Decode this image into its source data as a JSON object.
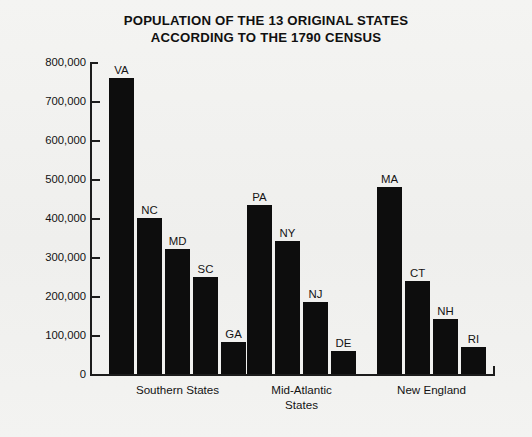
{
  "chart_data": {
    "type": "bar",
    "title": "POPULATION OF THE 13 ORIGINAL STATES ACCORDING TO THE 1790 CENSUS",
    "title_lines": [
      "POPULATION OF THE 13 ORIGINAL STATES",
      "ACCORDING TO THE 1790 CENSUS"
    ],
    "xlabel": "",
    "ylabel": "",
    "ylim": [
      0,
      800000
    ],
    "ytick_values": [
      0,
      100000,
      200000,
      300000,
      400000,
      500000,
      600000,
      700000,
      800000
    ],
    "ytick_labels": [
      "0",
      "100,000",
      "200,000",
      "300,000",
      "400,000",
      "500,000",
      "600,000",
      "700,000",
      "800,000"
    ],
    "grid": false,
    "legend": false,
    "bar_color": "#0d0d0d",
    "background_color": "#f2f2f0",
    "axis_color": "#1c1c1c",
    "categories": [
      "VA",
      "NC",
      "MD",
      "SC",
      "GA",
      "PA",
      "NY",
      "NJ",
      "DE",
      "MA",
      "CT",
      "NH",
      "RI"
    ],
    "values": [
      759000,
      400000,
      320000,
      249000,
      83000,
      434000,
      340000,
      184000,
      59000,
      479000,
      238000,
      142000,
      69000
    ],
    "groups": [
      {
        "label": "Southern States",
        "label_lines": [
          "Southern States"
        ],
        "bars": [
          {
            "label": "VA",
            "value": 759000
          },
          {
            "label": "NC",
            "value": 400000
          },
          {
            "label": "MD",
            "value": 320000
          },
          {
            "label": "SC",
            "value": 249000
          },
          {
            "label": "GA",
            "value": 83000
          }
        ]
      },
      {
        "label": "Mid-Atlantic States",
        "label_lines": [
          "Mid-Atlantic",
          "States"
        ],
        "bars": [
          {
            "label": "PA",
            "value": 434000
          },
          {
            "label": "NY",
            "value": 340000
          },
          {
            "label": "NJ",
            "value": 184000
          },
          {
            "label": "DE",
            "value": 59000
          }
        ]
      },
      {
        "label": "New England",
        "label_lines": [
          "New England"
        ],
        "bars": [
          {
            "label": "MA",
            "value": 479000
          },
          {
            "label": "CT",
            "value": 238000
          },
          {
            "label": "NH",
            "value": 142000
          },
          {
            "label": "RI",
            "value": 69000
          }
        ]
      }
    ]
  }
}
